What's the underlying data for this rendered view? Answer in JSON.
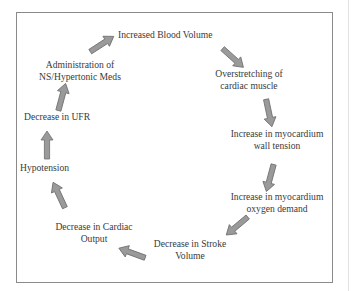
{
  "diagram": {
    "title": "",
    "nodes": [
      {
        "id": "n1",
        "lines": [
          "Increased Blood Volume"
        ]
      },
      {
        "id": "n2",
        "lines": [
          "Overstretching of",
          "cardiac muscle"
        ]
      },
      {
        "id": "n3",
        "lines": [
          "Increase in myocardium",
          "wall tension"
        ]
      },
      {
        "id": "n4",
        "lines": [
          "Increase in myocardium",
          "oxygen demand"
        ]
      },
      {
        "id": "n5",
        "lines": [
          "Decrease in Stroke",
          "Volume"
        ]
      },
      {
        "id": "n6",
        "lines": [
          "Decrease in Cardiac",
          "Output"
        ]
      },
      {
        "id": "n7",
        "lines": [
          "Hypotension"
        ]
      },
      {
        "id": "n8",
        "lines": [
          "Decrease in UFR"
        ]
      },
      {
        "id": "n9",
        "lines": [
          "Administration of",
          "NS/Hypertonic Meds"
        ]
      }
    ],
    "edges": [
      {
        "from": "n1",
        "to": "n2"
      },
      {
        "from": "n2",
        "to": "n3"
      },
      {
        "from": "n3",
        "to": "n4"
      },
      {
        "from": "n4",
        "to": "n5"
      },
      {
        "from": "n5",
        "to": "n6"
      },
      {
        "from": "n6",
        "to": "n7"
      },
      {
        "from": "n7",
        "to": "n8"
      },
      {
        "from": "n8",
        "to": "n9"
      },
      {
        "from": "n9",
        "to": "n1"
      }
    ],
    "colors": {
      "arrow_fill": "#9a9a9a",
      "arrow_stroke": "#6e6e6e",
      "text": "#3a3a3a",
      "frame": "#8a8a8a"
    }
  }
}
